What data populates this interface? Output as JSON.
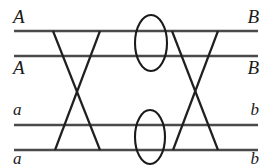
{
  "diagram": {
    "canvas": {
      "width": 272,
      "height": 167,
      "background": "#ffffff"
    },
    "stroke_color": "#4a4a4a",
    "diagonal_color": "#1f1f1f",
    "ellipse_color": "#1a1a1a",
    "labels": {
      "left_top": "A",
      "left_second": "A",
      "left_third": "a",
      "left_bottom": "a",
      "right_top": "B",
      "right_second": "B",
      "right_third": "b",
      "right_bottom": "b"
    },
    "chromatid_lines": [
      {
        "name": "chromatid-line-1",
        "y": 31,
        "x1": 14,
        "x2": 258
      },
      {
        "name": "chromatid-line-2",
        "y": 56,
        "x1": 14,
        "x2": 258
      },
      {
        "name": "chromatid-line-3",
        "y": 125,
        "x1": 14,
        "x2": 258
      },
      {
        "name": "chromatid-line-4",
        "y": 150,
        "x1": 14,
        "x2": 258
      }
    ],
    "crossover_diagonals": [
      {
        "name": "chiasma-left-descending",
        "x1": 53,
        "y1": 31,
        "x2": 100,
        "y2": 150
      },
      {
        "name": "chiasma-left-ascending",
        "x1": 100,
        "y1": 31,
        "x2": 55,
        "y2": 150
      },
      {
        "name": "chiasma-right-descending",
        "x1": 172,
        "y1": 31,
        "x2": 218,
        "y2": 150
      },
      {
        "name": "chiasma-right-ascending",
        "x1": 218,
        "y1": 31,
        "x2": 173,
        "y2": 150
      }
    ],
    "centromeres": [
      {
        "name": "centromere-upper",
        "cx": 151,
        "cy": 43,
        "rx": 16,
        "ry": 28
      },
      {
        "name": "centromere-lower",
        "cx": 150,
        "cy": 137,
        "rx": 15,
        "ry": 27
      }
    ]
  }
}
